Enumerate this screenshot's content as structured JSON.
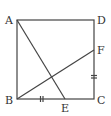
{
  "diagram": {
    "type": "geometry",
    "shape": "square ABCD",
    "points": {
      "A": {
        "label": "A",
        "x": 17,
        "y": 20
      },
      "B": {
        "label": "B",
        "x": 17,
        "y": 99
      },
      "C": {
        "label": "C",
        "x": 94,
        "y": 99
      },
      "D": {
        "label": "D",
        "x": 94,
        "y": 20
      },
      "E": {
        "label": "E",
        "x": 65,
        "y": 99
      },
      "F": {
        "label": "F",
        "x": 94,
        "y": 50
      }
    },
    "segments": [
      "AB",
      "BC",
      "CD",
      "DA",
      "AE",
      "BF"
    ],
    "equal_marks": [
      "BE",
      "FC"
    ],
    "colors": {
      "line": "#444444",
      "text": "#333333"
    }
  }
}
